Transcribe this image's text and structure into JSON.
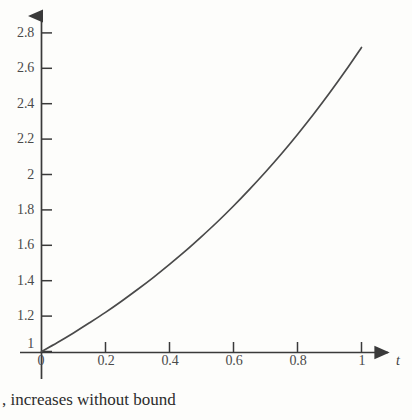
{
  "caption": ", increases without bound",
  "colors": {
    "background": "#fdfdfb",
    "axis": "#3a3a3a",
    "curve": "#4a4a4a",
    "tick_label": "#4a4a4a",
    "caption": "#2c2c2c"
  },
  "axes": {
    "x_title": "t",
    "y_title": ""
  },
  "chart_data": {
    "type": "line",
    "title": "",
    "subtitle": "",
    "xlabel": "t",
    "ylabel": "",
    "grid": false,
    "legend": null,
    "xlim": [
      0,
      1.09
    ],
    "ylim": [
      0.95,
      2.92
    ],
    "x_ticks": [
      0,
      0.2,
      0.4,
      0.6,
      0.8,
      1
    ],
    "x_tick_labels": [
      "0",
      "0.2",
      "0.4",
      "0.6",
      "0.8",
      "1"
    ],
    "y_ticks": [
      1,
      1.2,
      1.4,
      1.6,
      1.8,
      2,
      2.2,
      2.4,
      2.6,
      2.8
    ],
    "y_tick_labels": [
      "1",
      "1.2",
      "1.4",
      "1.6",
      "1.8",
      "2",
      "2.2",
      "2.4",
      "2.6",
      "2.8"
    ],
    "annotations": [],
    "series": [
      {
        "name": "e^t",
        "x": [
          0,
          0.05,
          0.1,
          0.15,
          0.2,
          0.25,
          0.3,
          0.35,
          0.4,
          0.45,
          0.5,
          0.55,
          0.6,
          0.65,
          0.7,
          0.75,
          0.8,
          0.85,
          0.9,
          0.95,
          1
        ],
        "y": [
          1,
          1.051,
          1.105,
          1.162,
          1.221,
          1.284,
          1.35,
          1.419,
          1.492,
          1.568,
          1.649,
          1.733,
          1.822,
          1.916,
          2.014,
          2.117,
          2.226,
          2.34,
          2.46,
          2.586,
          2.718
        ]
      }
    ]
  }
}
